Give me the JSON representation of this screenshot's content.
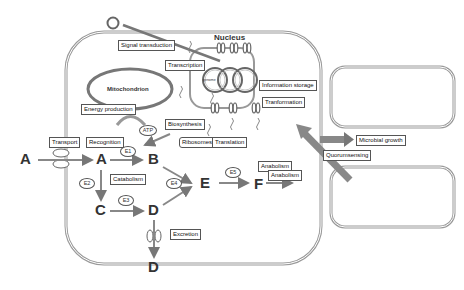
{
  "diagram": {
    "compartments": {
      "nucleus": "Nucleus",
      "mitochondrion": "Mitochondrion",
      "genome": "genome"
    },
    "labels": {
      "signal_transduction": "Signal transduction",
      "transcription": "Transcription",
      "information_storage": "Information storage",
      "tranformation": "Tranformation",
      "energy_production": "Energy production",
      "atp": "ATP",
      "biosynthesis": "Biosynthesis",
      "ribosomes": "Ribosomes",
      "translation": "Translation",
      "transport": "Transport",
      "recognition": "Recognition",
      "catabolism": "Catabolism",
      "anabolism_1": "Anabolism",
      "anabolism_2": "Anabolism",
      "excretion": "Excretion",
      "microbial_growth": "Microbial growth",
      "quorumsensing": "Quorumsensing"
    },
    "metabolites": {
      "a_outside": "A",
      "a_inside": "A",
      "b": "B",
      "c": "C",
      "d_inside": "D",
      "d_outside": "D",
      "e": "E",
      "f": "F"
    },
    "enzymes": {
      "e1": "E1",
      "e2": "E2",
      "e3": "E3",
      "e4": "E4",
      "e5": "E5"
    },
    "colors": {
      "membrane": "#9a9a9a",
      "arrow": "#888888",
      "text": "#222222"
    }
  }
}
